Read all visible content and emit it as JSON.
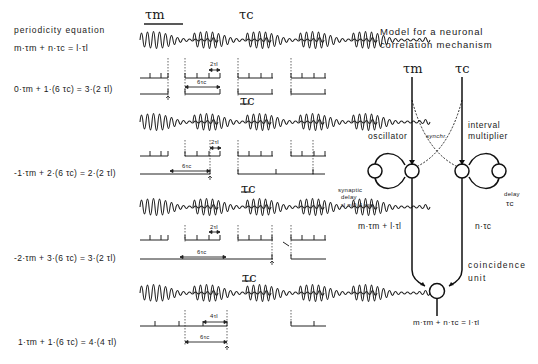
{
  "left_panel": {
    "heading": "periodicity equation",
    "general_equation": "m·τm + n·τc = l·τl",
    "examples": [
      {
        "equation": "0·τm + 1·(6 τc) = 3·(2 τl)"
      },
      {
        "equation": "-1·τm + 2·(6 τc) = 2·(2 τl)"
      },
      {
        "equation": "-2·τm + 3·(6 τc) = 3·(2 τl)"
      },
      {
        "equation": "1·τm + 1·(6 τc) = 4·(4 τl)"
      }
    ]
  },
  "waveforms": {
    "tau_m_label": "τm",
    "tau_c_label": "τc",
    "rows": [
      {
        "small_interval": "2τl",
        "large_interval": "6τc"
      },
      {
        "small_interval": "2τl",
        "large_interval": "6τc"
      },
      {
        "small_interval": "2τl",
        "large_interval": "6τc"
      },
      {
        "small_interval": "4τl",
        "large_interval": "6τc"
      }
    ]
  },
  "model": {
    "title_line1": "Model for a neuronal",
    "title_line2": "correlation mechanism",
    "input_m": "τm",
    "input_c": "τc",
    "oscillator_label": "oscillator",
    "interval_label_line1": "interval",
    "interval_label_line2": "multiplier",
    "synchr_label": "synchr.",
    "synaptic_delay_line1": "synaptic",
    "synaptic_delay_line2": "delay",
    "synaptic_delay_value": "τl = 0.4 ms",
    "delay_label": "delay",
    "delay_tau": "τc",
    "left_branch_eq": "m·τm + l·τl",
    "right_branch_eq": "n·τc",
    "coincidence_line1": "coincidence",
    "coincidence_line2": "unit",
    "output_eq": "m·τm + n·τc = l·τl"
  }
}
